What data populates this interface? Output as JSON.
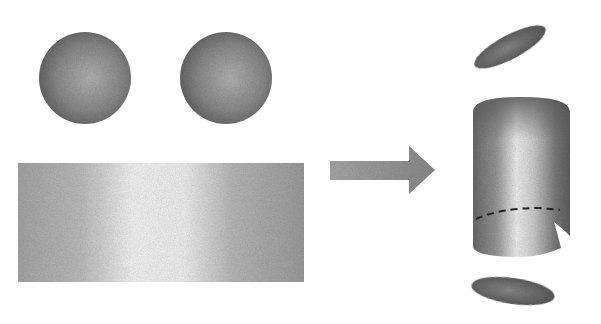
{
  "diagram": {
    "net": {
      "circles": [
        {
          "name": "top-base-circle",
          "cx": 85,
          "cy": 78,
          "r": 46
        },
        {
          "name": "bottom-base-circle",
          "cx": 226,
          "cy": 78,
          "r": 46
        }
      ],
      "rectangle": {
        "name": "lateral-surface",
        "x": 18,
        "y": 163,
        "width": 286,
        "height": 119
      }
    },
    "arrow": {
      "direction": "right",
      "from_x": 330,
      "to_x": 435,
      "y": 170
    },
    "cylinder": {
      "top_lid": {
        "cx": 510,
        "cy": 47,
        "rx": 40,
        "ry": 13,
        "rotate": -28
      },
      "body": {
        "x": 473,
        "y": 97,
        "width": 97,
        "height": 160
      },
      "seam_dashed_y": 210,
      "bottom_lid": {
        "cx": 513,
        "cy": 291,
        "rx": 42,
        "ry": 14,
        "rotate": 8
      }
    },
    "colors": {
      "background": "#ffffff",
      "dark": "#5a5a5a",
      "mid": "#8c8c8c",
      "light": "#f2f2f2",
      "dash": "#222222"
    }
  }
}
